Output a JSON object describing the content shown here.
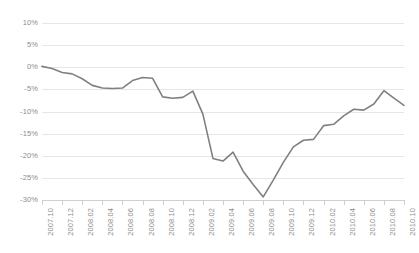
{
  "chart_data": {
    "type": "line",
    "title": "",
    "subtitle": "",
    "xlabel": "",
    "ylabel": "",
    "grid": true,
    "legend": false,
    "legend_position": "none",
    "line_color": "#808080",
    "gridline_color": "#e6e6e6",
    "axis_color": "#d0d0d0",
    "tick_label_color": "#8c8c8c",
    "ylim": [
      -30,
      10
    ],
    "ytick_values": [
      10,
      5,
      0,
      -5,
      -10,
      -15,
      -20,
      -25,
      -30
    ],
    "ytick_labels": [
      "10%",
      "5%",
      "0%",
      "-5%",
      "-10%",
      "-15%",
      "-20%",
      "-25%",
      "-30%"
    ],
    "xtick_labels": [
      "2007.10",
      "2007.12",
      "2008.02",
      "2008.04",
      "2008.06",
      "2008.08",
      "2008.10",
      "2008.12",
      "2009.02",
      "2009.04",
      "2009.06",
      "2009.08",
      "2009.10",
      "2009.12",
      "2010.02",
      "2010.04",
      "2010.06",
      "2010.08",
      "2010.10"
    ],
    "x": [
      "2007.10",
      "2007.11",
      "2007.12",
      "2008.01",
      "2008.02",
      "2008.03",
      "2008.04",
      "2008.05",
      "2008.06",
      "2008.07",
      "2008.08",
      "2008.09",
      "2008.10",
      "2008.11",
      "2008.12",
      "2009.01",
      "2009.02",
      "2009.03",
      "2009.04",
      "2009.05",
      "2009.06",
      "2009.07",
      "2009.08",
      "2009.09",
      "2009.10",
      "2009.11",
      "2009.12",
      "2010.01",
      "2010.02",
      "2010.03",
      "2010.04",
      "2010.05",
      "2010.06",
      "2010.07",
      "2010.08",
      "2010.09",
      "2010.10"
    ],
    "values": [
      0.2,
      -0.3,
      -1.2,
      -1.5,
      -2.6,
      -4.1,
      -4.7,
      -4.8,
      -4.7,
      -3.0,
      -2.3,
      -2.5,
      -6.7,
      -7.0,
      -6.8,
      -5.4,
      -10.6,
      -20.6,
      -21.2,
      -19.2,
      -23.5,
      -26.5,
      -29.3,
      -25.5,
      -21.5,
      -18.0,
      -16.5,
      -16.3,
      -13.2,
      -12.9,
      -11.0,
      -9.5,
      -9.7,
      -8.3,
      -5.3,
      -7.0,
      -8.6
    ],
    "values_note": "percent change"
  }
}
